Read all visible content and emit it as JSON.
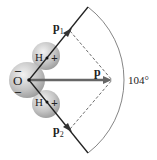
{
  "diagram": {
    "type": "water-molecule-dipole",
    "labels": {
      "oxygen": "O",
      "hydrogen_top": "H",
      "hydrogen_bottom": "H",
      "plus_top": "+",
      "plus_bottom": "+",
      "minus_top": "–",
      "minus_bottom": "–",
      "p1": "p",
      "p1_sub": "1",
      "p2": "p",
      "p2_sub": "2",
      "p": "p",
      "angle": "104°"
    },
    "colors": {
      "bond": "#222222",
      "arrow": "#666666",
      "atom": "#bdbdbd",
      "dashed": "#444444"
    }
  }
}
